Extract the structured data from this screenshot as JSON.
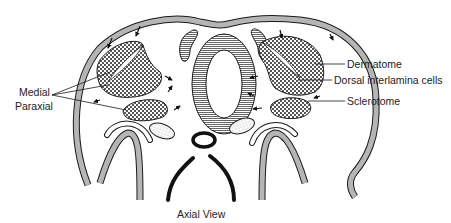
{
  "title": "Axial View",
  "labels": {
    "medial": "Medial",
    "paraxial": "Paraxial",
    "dermatome": "Dermatome",
    "dorsal_interlamina": "Dorsal interlamina cells",
    "sclerotome": "Sclerotome"
  },
  "colors": {
    "outline": "#1a1a1a",
    "wall_fill": "#b5b5b5",
    "background": "#ffffff"
  }
}
